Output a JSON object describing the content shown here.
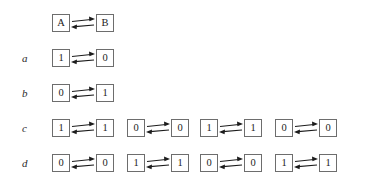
{
  "figure": {
    "title": "",
    "background_color": "#ffffff",
    "box_border_color": "#6d6d6d",
    "text_color": "#1c1c1c",
    "label_color": "#2b2b2b",
    "arrow_color": "#1c1c1c",
    "arrow_icon_name": "bidirectional-equilibrium-arrows",
    "layout": {
      "label_x": 22,
      "column_x": [
        52,
        127,
        200,
        275
      ],
      "row_y": [
        12,
        47,
        82,
        117,
        152
      ],
      "node_size": 18,
      "arrow_gap": 26
    }
  },
  "rows": [
    {
      "label": "",
      "name": "row-header",
      "pairs": [
        {
          "left": "A",
          "right": "B",
          "column": 0
        }
      ]
    },
    {
      "label": "a",
      "name": "row-a",
      "pairs": [
        {
          "left": "1",
          "right": "0",
          "column": 0
        }
      ]
    },
    {
      "label": "b",
      "name": "row-b",
      "pairs": [
        {
          "left": "0",
          "right": "1",
          "column": 0
        }
      ]
    },
    {
      "label": "c",
      "name": "row-c",
      "pairs": [
        {
          "left": "1",
          "right": "1",
          "column": 0
        },
        {
          "left": "0",
          "right": "0",
          "column": 1
        },
        {
          "left": "1",
          "right": "1",
          "column": 2
        },
        {
          "left": "0",
          "right": "0",
          "column": 3
        }
      ]
    },
    {
      "label": "d",
      "name": "row-d",
      "pairs": [
        {
          "left": "0",
          "right": "0",
          "column": 0
        },
        {
          "left": "1",
          "right": "1",
          "column": 1
        },
        {
          "left": "0",
          "right": "0",
          "column": 2
        },
        {
          "left": "1",
          "right": "1",
          "column": 3
        }
      ]
    }
  ]
}
